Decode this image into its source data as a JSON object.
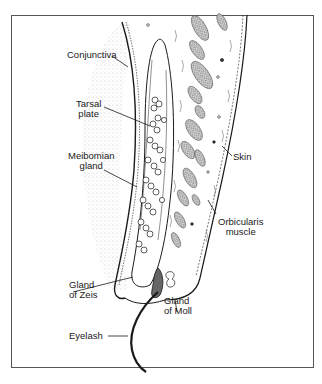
{
  "figure": {
    "labels": {
      "conjunctiva": "Conjunctiva",
      "tarsal_plate": [
        "Tarsal",
        "plate"
      ],
      "meibomian_gland": [
        "Meibomian",
        "gland"
      ],
      "skin": "Skin",
      "orbicularis_muscle": [
        "Orbicularis",
        "muscle"
      ],
      "gland_of_zeis": [
        "Gland",
        "of Zeis"
      ],
      "gland_of_moll": [
        "Gland",
        "of Moll"
      ],
      "eyelash": "Eyelash"
    },
    "colors": {
      "ink": "#1a1a1a",
      "frame": "#555555",
      "stipple": "#8a8a8a",
      "background": "#ffffff"
    }
  }
}
